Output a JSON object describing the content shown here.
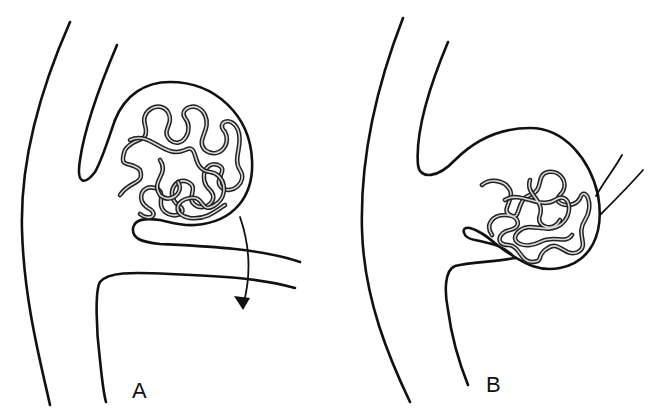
{
  "figure": {
    "panels": [
      {
        "id": "A",
        "label": "A",
        "description": "Aneurysm sac filled with coil mass; arrow indicates coil migration/flow into branch vessel"
      },
      {
        "id": "B",
        "label": "B",
        "description": "Aneurysm sac with compacted coil mass; branch vessel emerges from sac wall"
      }
    ],
    "colors": {
      "line": "#111111",
      "coil": "#222222",
      "coil_core": "#d8d8d8",
      "background": "#ffffff"
    }
  }
}
